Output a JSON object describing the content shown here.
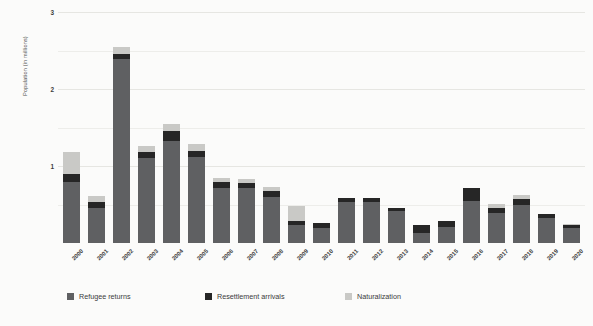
{
  "chart_data": {
    "type": "bar",
    "stacked": true,
    "title": "",
    "subtitle": "",
    "xlabel": "",
    "ylabel": "Population (in millions)",
    "ylim": [
      0,
      3
    ],
    "yticks": [
      1,
      2,
      3
    ],
    "ytick_labels": [
      "1",
      "2",
      "3"
    ],
    "grid": true,
    "grid_axis": "y",
    "legend_position": "bottom",
    "categories": [
      "2000",
      "2001",
      "2002",
      "2003",
      "2004",
      "2005",
      "2006",
      "2007",
      "2008",
      "2009",
      "2010",
      "2011",
      "2012",
      "2013",
      "2014",
      "2015",
      "2016",
      "2017",
      "2018",
      "2019",
      "2020"
    ],
    "series": [
      {
        "name": "Refugee returns",
        "color": "#5f6062",
        "values": [
          0.79,
          0.46,
          2.39,
          1.11,
          1.32,
          1.12,
          0.72,
          0.71,
          0.6,
          0.23,
          0.2,
          0.53,
          0.53,
          0.41,
          0.13,
          0.21,
          0.55,
          0.39,
          0.5,
          0.32,
          0.2
        ]
      },
      {
        "name": "Resettlement arrivals",
        "color": "#262626",
        "values": [
          0.1,
          0.07,
          0.07,
          0.07,
          0.13,
          0.07,
          0.07,
          0.07,
          0.07,
          0.06,
          0.06,
          0.06,
          0.06,
          0.05,
          0.1,
          0.08,
          0.16,
          0.07,
          0.07,
          0.06,
          0.04
        ]
      },
      {
        "name": "Naturalization",
        "color": "#c9c9c6",
        "values": [
          0.29,
          0.08,
          0.09,
          0.08,
          0.1,
          0.09,
          0.05,
          0.05,
          0.06,
          0.19,
          0.0,
          0.0,
          0.0,
          0.0,
          0.0,
          0.0,
          0.0,
          0.05,
          0.05,
          0.0,
          0.01
        ]
      }
    ],
    "totals": [
      1.18,
      0.61,
      2.55,
      1.26,
      1.55,
      1.28,
      0.84,
      0.83,
      0.73,
      0.48,
      0.26,
      0.59,
      0.59,
      0.46,
      0.23,
      0.29,
      0.71,
      0.51,
      0.62,
      0.38,
      0.25
    ]
  },
  "legend": {
    "items": [
      {
        "label": "Refugee returns",
        "color": "#5f6062"
      },
      {
        "label": "Resettlement arrivals",
        "color": "#262626"
      },
      {
        "label": "Naturalization",
        "color": "#c9c9c6"
      }
    ]
  },
  "colors": {
    "background": "#fbfbfa",
    "gridline": "#ededea",
    "text": "#3f3f3f"
  }
}
